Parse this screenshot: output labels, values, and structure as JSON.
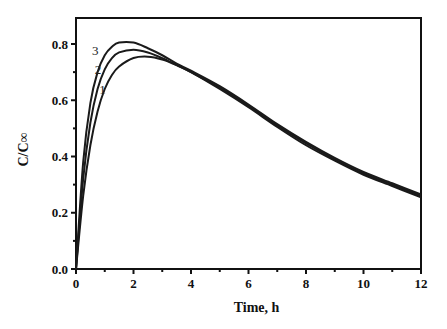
{
  "chart_data": {
    "type": "line",
    "title": "",
    "xlabel": "Time, h",
    "ylabel": "C/C∞",
    "xlim": [
      0,
      12
    ],
    "ylim": [
      0,
      0.85
    ],
    "xticks": [
      0,
      2,
      4,
      6,
      8,
      10,
      12
    ],
    "yticks": [
      0.0,
      0.2,
      0.4,
      0.6,
      0.8
    ],
    "xtick_labels": [
      "0",
      "2",
      "4",
      "6",
      "8",
      "10",
      "12"
    ],
    "ytick_labels": [
      "0.0",
      "0.2",
      "0.4",
      "0.6",
      "0.8"
    ],
    "grid": false,
    "legend": "inline curve labels 1, 2, 3",
    "series": [
      {
        "name": "1",
        "x": [
          0,
          0.25,
          0.5,
          0.75,
          1.0,
          1.25,
          1.5,
          2.0,
          2.5,
          3.0,
          3.5,
          4.0,
          5.0,
          6.0,
          7.0,
          8.0,
          9.0,
          10.0,
          11.0,
          12.0
        ],
        "values": [
          0,
          0.26,
          0.44,
          0.56,
          0.64,
          0.69,
          0.72,
          0.75,
          0.755,
          0.745,
          0.725,
          0.7,
          0.64,
          0.575,
          0.505,
          0.44,
          0.385,
          0.335,
          0.295,
          0.255
        ]
      },
      {
        "name": "2",
        "x": [
          0,
          0.25,
          0.5,
          0.75,
          1.0,
          1.25,
          1.5,
          2.0,
          2.5,
          3.0,
          3.5,
          4.0,
          5.0,
          6.0,
          7.0,
          8.0,
          9.0,
          10.0,
          11.0,
          12.0
        ],
        "values": [
          0,
          0.32,
          0.52,
          0.64,
          0.71,
          0.75,
          0.77,
          0.78,
          0.77,
          0.75,
          0.725,
          0.7,
          0.645,
          0.58,
          0.51,
          0.447,
          0.39,
          0.34,
          0.3,
          0.26
        ]
      },
      {
        "name": "3",
        "x": [
          0,
          0.25,
          0.5,
          0.75,
          1.0,
          1.25,
          1.5,
          2.0,
          2.5,
          3.0,
          3.5,
          4.0,
          5.0,
          6.0,
          7.0,
          8.0,
          9.0,
          10.0,
          11.0,
          12.0
        ],
        "values": [
          0,
          0.38,
          0.59,
          0.7,
          0.76,
          0.79,
          0.805,
          0.805,
          0.785,
          0.76,
          0.73,
          0.705,
          0.65,
          0.585,
          0.515,
          0.452,
          0.395,
          0.345,
          0.305,
          0.265
        ]
      }
    ],
    "annotations": [
      {
        "text": "1",
        "x": 1.1,
        "y": 0.64
      },
      {
        "text": "2",
        "x": 0.95,
        "y": 0.71
      },
      {
        "text": "3",
        "x": 0.85,
        "y": 0.78
      }
    ]
  },
  "plot": {
    "left": 76,
    "right": 421,
    "top": 18,
    "bottom": 269,
    "line_color": "#1a1a1a",
    "axis_color": "#111111"
  }
}
